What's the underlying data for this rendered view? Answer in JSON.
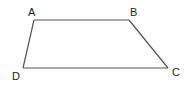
{
  "diagram": {
    "type": "trapezoid",
    "stroke_color": "#555555",
    "label_color": "#222222",
    "vertices": [
      {
        "name": "A",
        "x": 34,
        "y": 20,
        "label_x": 28,
        "label_y": 16
      },
      {
        "name": "B",
        "x": 129,
        "y": 20,
        "label_x": 130,
        "label_y": 16
      },
      {
        "name": "C",
        "x": 168,
        "y": 68,
        "label_x": 172,
        "label_y": 76
      },
      {
        "name": "D",
        "x": 23,
        "y": 68,
        "label_x": 12,
        "label_y": 80
      }
    ],
    "edges": [
      {
        "from": "A",
        "to": "B"
      },
      {
        "from": "B",
        "to": "C"
      },
      {
        "from": "C",
        "to": "D"
      },
      {
        "from": "D",
        "to": "A"
      }
    ]
  }
}
